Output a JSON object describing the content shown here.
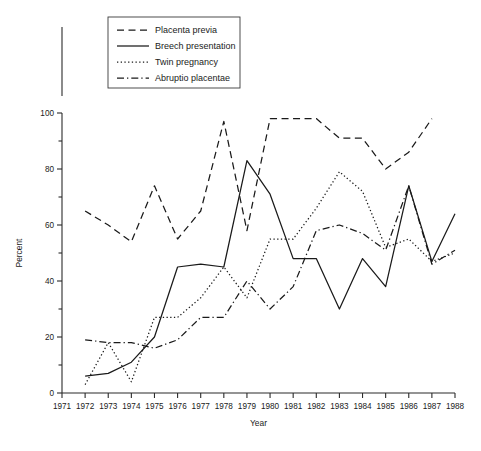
{
  "figure": {
    "background": "#ffffff",
    "ink_color": "#1a1a1a"
  },
  "axes": {
    "x_label": "Year",
    "y_label": "Percent",
    "x_ticks": [
      "1971",
      "1972",
      "1973",
      "1974",
      "1975",
      "1976",
      "1977",
      "1978",
      "1979",
      "1980",
      "1981",
      "1982",
      "1983",
      "1984",
      "1985",
      "1986",
      "1987",
      "1988"
    ],
    "y_ticks": [
      "0",
      "20",
      "40",
      "60",
      "80",
      "100"
    ],
    "y_minor_ticks": [
      "10",
      "30",
      "50",
      "70",
      "90"
    ]
  },
  "legend": {
    "position": "top-left",
    "entries": [
      {
        "label": "Placenta previa",
        "style": "dashed"
      },
      {
        "label": "Breech presentation",
        "style": "solid"
      },
      {
        "label": "Twin pregnancy",
        "style": "dotted"
      },
      {
        "label": "Abruptio placentae",
        "style": "dash-dot"
      }
    ]
  },
  "chart_data": {
    "type": "line",
    "title": "",
    "xlabel": "Year",
    "ylabel": "Percent",
    "xlim": [
      1971,
      1988
    ],
    "ylim": [
      0,
      100
    ],
    "grid": false,
    "legend_position": "upper left",
    "x": [
      1971,
      1972,
      1973,
      1974,
      1975,
      1976,
      1977,
      1978,
      1979,
      1980,
      1981,
      1982,
      1983,
      1984,
      1985,
      1986,
      1987,
      1988
    ],
    "series": [
      {
        "name": "Placenta previa",
        "style": "dashed",
        "x": [
          1972,
          1973,
          1974,
          1975,
          1976,
          1977,
          1978,
          1979,
          1980,
          1981,
          1982,
          1983,
          1984,
          1985,
          1986,
          1987
        ],
        "values": [
          65,
          60,
          54,
          74,
          55,
          65,
          97,
          58,
          98,
          98,
          98,
          91,
          91,
          80,
          86,
          98
        ]
      },
      {
        "name": "Breech presentation",
        "style": "solid",
        "x": [
          1972,
          1973,
          1974,
          1975,
          1976,
          1977,
          1978,
          1979,
          1980,
          1981,
          1982,
          1983,
          1984,
          1985,
          1986,
          1987,
          1988
        ],
        "values": [
          6,
          7,
          11,
          20,
          45,
          46,
          45,
          83,
          71,
          48,
          48,
          30,
          48,
          38,
          74,
          47,
          64
        ]
      },
      {
        "name": "Twin pregnancy",
        "style": "dotted",
        "x": [
          1972,
          1973,
          1974,
          1975,
          1976,
          1977,
          1978,
          1979,
          1980,
          1981,
          1982,
          1983,
          1984,
          1985,
          1986,
          1987,
          1988
        ],
        "values": [
          3,
          18,
          4,
          27,
          27,
          34,
          45,
          34,
          55,
          55,
          66,
          79,
          72,
          52,
          55,
          47,
          50
        ]
      },
      {
        "name": "Abruptio placentae",
        "style": "dash-dot",
        "x": [
          1972,
          1973,
          1974,
          1975,
          1976,
          1977,
          1978,
          1979,
          1980,
          1981,
          1982,
          1983,
          1984,
          1985,
          1986,
          1987,
          1988
        ],
        "values": [
          19,
          18,
          18,
          16,
          19,
          27,
          27,
          40,
          30,
          38,
          58,
          60,
          57,
          51,
          74,
          46,
          51
        ]
      }
    ]
  }
}
